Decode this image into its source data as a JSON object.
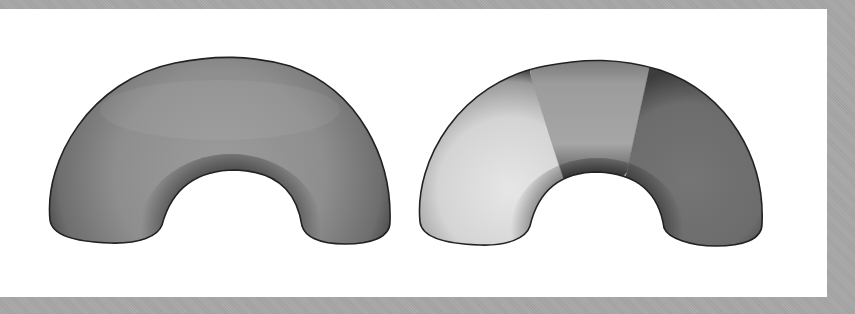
{
  "figure": {
    "background_color": "#a8a8a8",
    "panel_color": "#ffffff",
    "shapes": [
      {
        "name": "uniform-half-torus",
        "shading": "uniform",
        "base_color": "#8a8a8a"
      },
      {
        "name": "segmented-half-torus",
        "shading": "segmented",
        "segments": [
          {
            "name": "left-segment",
            "color": "#d8d8d8"
          },
          {
            "name": "middle-segment",
            "color": "#a2a2a2"
          },
          {
            "name": "right-segment",
            "color": "#707070"
          }
        ]
      }
    ]
  }
}
